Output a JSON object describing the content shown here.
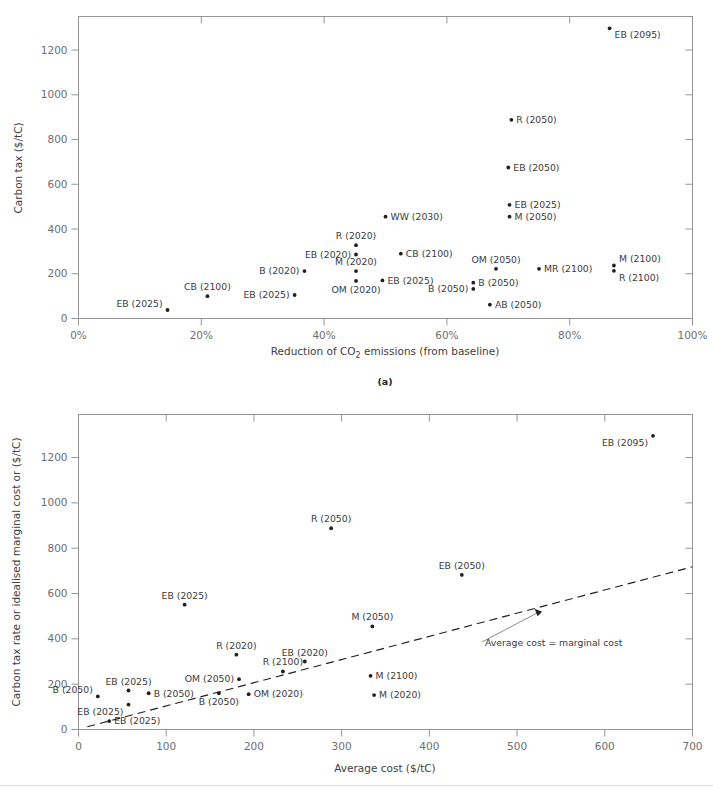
{
  "figure": {
    "background": "#ffffff",
    "axis_color": "#939598",
    "marker_color": "#231f20",
    "text_color": "#3b3b3d"
  },
  "chart_data": [
    {
      "id": "panel-a",
      "type": "scatter",
      "caption": "(a)",
      "title": "",
      "xlabel": "Reduction of CO2 emissions (from baseline)",
      "xlabel_parts": {
        "pre": "Reduction of CO",
        "sub": "2",
        "post": " emissions (from baseline)"
      },
      "ylabel": "Carbon tax ($/tC)",
      "xlim": [
        0,
        100
      ],
      "ylim": [
        0,
        1350
      ],
      "xticks": [
        0,
        20,
        40,
        60,
        80,
        100
      ],
      "xticklabels": [
        "0%",
        "20%",
        "40%",
        "60%",
        "80%",
        "100%"
      ],
      "yticks": [
        0,
        200,
        400,
        600,
        800,
        1000,
        1200
      ],
      "yticklabels": [
        "0",
        "200",
        "400",
        "600",
        "800",
        "1000",
        "1200"
      ],
      "grid": false,
      "legend": "none",
      "points": [
        {
          "label": "EB (2095)",
          "x": 86.5,
          "y": 1297,
          "lp": "below-right"
        },
        {
          "label": "R (2050)",
          "x": 70.5,
          "y": 888,
          "lp": "right"
        },
        {
          "label": "EB (2050)",
          "x": 70.0,
          "y": 675,
          "lp": "right"
        },
        {
          "label": "EB (2025)",
          "x": 70.2,
          "y": 508,
          "lp": "right"
        },
        {
          "label": "M (2050)",
          "x": 70.2,
          "y": 455,
          "lp": "right"
        },
        {
          "label": "WW (2030)",
          "x": 50.0,
          "y": 455,
          "lp": "right"
        },
        {
          "label": "R (2020)",
          "x": 45.2,
          "y": 328,
          "lp": "above"
        },
        {
          "label": "CB (2100)",
          "x": 52.5,
          "y": 290,
          "lp": "right"
        },
        {
          "label": "EB (2020)",
          "x": 45.2,
          "y": 286,
          "lp": "left"
        },
        {
          "label": "M (2100)",
          "x": 87.2,
          "y": 237,
          "lp": "above-right"
        },
        {
          "label": "R (2100)",
          "x": 87.2,
          "y": 213,
          "lp": "below-right"
        },
        {
          "label": "MR (2100)",
          "x": 75.0,
          "y": 222,
          "lp": "right"
        },
        {
          "label": "OM (2050)",
          "x": 68.0,
          "y": 222,
          "lp": "above"
        },
        {
          "label": "B (2020)",
          "x": 36.8,
          "y": 212,
          "lp": "left"
        },
        {
          "label": "M (2020)",
          "x": 45.2,
          "y": 212,
          "lp": "above"
        },
        {
          "label": "EB (2025)",
          "x": 49.5,
          "y": 170,
          "lp": "right"
        },
        {
          "label": "OM (2020)",
          "x": 45.2,
          "y": 168,
          "lp": "below"
        },
        {
          "label": "B (2050)",
          "x": 64.3,
          "y": 160,
          "lp": "right"
        },
        {
          "label": "B (2050)",
          "x": 64.3,
          "y": 132,
          "lp": "left"
        },
        {
          "label": "EB (2025)",
          "x": 35.2,
          "y": 105,
          "lp": "left"
        },
        {
          "label": "CB (2100)",
          "x": 21.0,
          "y": 100,
          "lp": "above"
        },
        {
          "label": "AB (2050)",
          "x": 67.0,
          "y": 62,
          "lp": "right"
        },
        {
          "label": "EB (2025)",
          "x": 14.5,
          "y": 38,
          "lp": "above-left"
        }
      ]
    },
    {
      "id": "panel-b",
      "type": "scatter",
      "caption": "",
      "title": "",
      "xlabel": "Average cost ($/tC)",
      "ylabel": "Carbon tax rate or idealised marginal cost or ($/tC)",
      "xlim": [
        0,
        700
      ],
      "ylim": [
        0,
        1390
      ],
      "xticks": [
        0,
        100,
        200,
        300,
        400,
        500,
        600,
        700
      ],
      "xticklabels": [
        "0",
        "100",
        "200",
        "300",
        "400",
        "500",
        "600",
        "700"
      ],
      "yticks": [
        0,
        200,
        400,
        600,
        800,
        1000,
        1200
      ],
      "yticklabels": [
        "0",
        "200",
        "400",
        "600",
        "800",
        "1000",
        "1200"
      ],
      "grid": false,
      "legend": "none",
      "annotation": {
        "text": "Average cost = marginal cost",
        "arrow_target_x": 520,
        "arrow_target_y": 533
      },
      "trendline": {
        "type": "dashed",
        "x0": 10,
        "y0": 12,
        "x1": 700,
        "y1": 718,
        "slope": 1.023
      },
      "points": [
        {
          "label": "EB (2095)",
          "x": 655,
          "y": 1296,
          "lp": "below-left"
        },
        {
          "label": "R (2050)",
          "x": 288,
          "y": 888,
          "lp": "above"
        },
        {
          "label": "EB (2050)",
          "x": 437,
          "y": 682,
          "lp": "above"
        },
        {
          "label": "EB (2025)",
          "x": 121,
          "y": 551,
          "lp": "above"
        },
        {
          "label": "M (2050)",
          "x": 335,
          "y": 455,
          "lp": "above"
        },
        {
          "label": "R (2020)",
          "x": 180,
          "y": 330,
          "lp": "above"
        },
        {
          "label": "EB (2020)",
          "x": 258,
          "y": 300,
          "lp": "above"
        },
        {
          "label": "R (2100)",
          "x": 233,
          "y": 256,
          "lp": "above"
        },
        {
          "label": "M (2100)",
          "x": 333,
          "y": 237,
          "lp": "right"
        },
        {
          "label": "OM (2050)",
          "x": 183,
          "y": 222,
          "lp": "left"
        },
        {
          "label": "EB (2025)",
          "x": 57,
          "y": 172,
          "lp": "above"
        },
        {
          "label": "B (2050)",
          "x": 80,
          "y": 160,
          "lp": "right"
        },
        {
          "label": "B (2050)",
          "x": 160,
          "y": 160,
          "lp": "below"
        },
        {
          "label": "OM (2020)",
          "x": 194,
          "y": 156,
          "lp": "right"
        },
        {
          "label": "M (2020)",
          "x": 337,
          "y": 152,
          "lp": "right"
        },
        {
          "label": "B (2050)",
          "x": 22,
          "y": 146,
          "lp": "above-left"
        },
        {
          "label": "EB (2025)",
          "x": 57,
          "y": 110,
          "lp": "below-left"
        },
        {
          "label": "EB (2025)",
          "x": 35,
          "y": 37,
          "lp": "right"
        }
      ]
    }
  ]
}
